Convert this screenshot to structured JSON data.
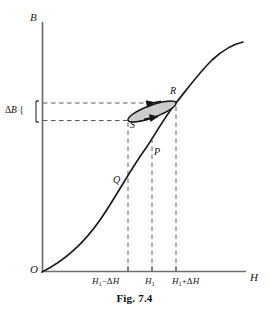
{
  "figure": {
    "caption": "Fig. 7.4",
    "caption_x": 0,
    "caption_y": 292,
    "width": 269,
    "height": 318,
    "background": "#ffffff",
    "ink_color": "#151515",
    "axis_color": "#6e6e74",
    "dash_color": "#5a5a60",
    "loop_fill": "#c9c9c9"
  },
  "axes": {
    "y_label": "B",
    "y_label_x": 30,
    "y_label_y": 12,
    "x_label": "H",
    "x_label_x": 250,
    "x_label_y": 272,
    "origin_label": "O",
    "origin_label_x": 30,
    "origin_label_y": 266,
    "origin_px": {
      "x": 42,
      "y": 272
    },
    "x_axis_end_px": {
      "x": 246,
      "y": 272
    },
    "y_axis_top_px": {
      "x": 42,
      "y": 22
    }
  },
  "x_ticks": [
    {
      "label_html": "<i>H</i><sub>1</sub>−Δ<i>H</i>",
      "x_px": 128,
      "label_x": 92,
      "label_y": 277
    },
    {
      "label_html": "<i>H</i><sub>1</sub>",
      "x_px": 152,
      "label_x": 145,
      "label_y": 277
    },
    {
      "label_html": "<i>H</i><sub>1</sub>+Δ<i>H</i>",
      "x_px": 176,
      "label_x": 172,
      "label_y": 277
    }
  ],
  "y_bracket": {
    "label_html": "Δ<i>B</i> {",
    "label_x": 5,
    "label_y": 105,
    "top_y_px": 103,
    "bottom_y_px": 120
  },
  "points": [
    {
      "name": "R",
      "label": "R",
      "label_x": 170,
      "label_y": 88,
      "px": {
        "x": 176,
        "y": 103
      }
    },
    {
      "name": "S",
      "label": "S",
      "label_x": 131,
      "label_y": 120,
      "px": {
        "x": 128,
        "y": 120
      }
    },
    {
      "name": "P",
      "label": "P",
      "label_x": 154,
      "label_y": 148,
      "px": {
        "x": 152,
        "y": 158
      }
    },
    {
      "name": "Q",
      "label": "Q",
      "label_x": 114,
      "label_y": 176,
      "px": {
        "x": 128,
        "y": 188
      }
    }
  ],
  "chart_data": {
    "type": "line",
    "title": "Fig. 7.4",
    "xlabel": "H",
    "ylabel": "B",
    "grid": false,
    "legend": null,
    "annotations": [
      {
        "text": "R",
        "note": "upper end of minor loop on main curve"
      },
      {
        "text": "S",
        "note": "lower end of minor loop"
      },
      {
        "text": "P",
        "note": "operating point on main curve at H1"
      },
      {
        "text": "Q",
        "note": "point on main curve at H1 - dH"
      },
      {
        "text": "ΔB",
        "note": "flux density swing bracket on B axis"
      },
      {
        "text": "ΔH",
        "note": "field swing about H1"
      }
    ],
    "series": [
      {
        "name": "magnetization-curve",
        "type": "line",
        "points_px": [
          [
            42,
            272
          ],
          [
            54,
            265
          ],
          [
            66,
            255
          ],
          [
            78,
            243
          ],
          [
            90,
            229
          ],
          [
            102,
            214
          ],
          [
            114,
            198
          ],
          [
            126,
            181
          ],
          [
            138,
            163
          ],
          [
            150,
            144
          ],
          [
            160,
            127
          ],
          [
            168,
            113
          ],
          [
            176,
            103
          ],
          [
            184,
            90
          ],
          [
            192,
            78
          ],
          [
            200,
            68
          ],
          [
            210,
            58
          ],
          [
            220,
            51
          ],
          [
            232,
            45
          ],
          [
            242,
            42
          ]
        ]
      },
      {
        "name": "minor-hysteresis-loop",
        "type": "closed-ellipse",
        "center_px": [
          152,
          111
        ],
        "rx": 25,
        "ry": 6.0,
        "rotation_deg": -20,
        "filled": true
      }
    ],
    "dashed_guides": {
      "vertical_x_px": [
        128,
        152,
        176
      ],
      "vertical_from_y": 272,
      "horizontal_y_px": [
        103,
        120
      ],
      "horizontal_from_x": 42
    }
  }
}
